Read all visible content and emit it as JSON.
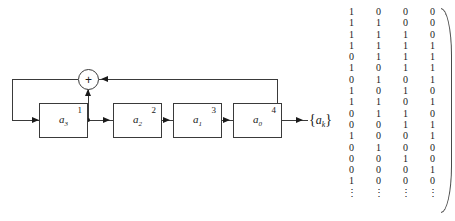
{
  "figure": {
    "kind": "lfsr-block-diagram-with-state-matrix",
    "output_label": {
      "open_brace": "{",
      "symbol": "a",
      "subscript": "k",
      "close_brace": "}"
    },
    "adder": {
      "symbol": "+",
      "name": "modulo-2-adder"
    },
    "stages": [
      {
        "symbol": "a",
        "subscript": "3",
        "tap": "1"
      },
      {
        "symbol": "a",
        "subscript": "2",
        "tap": "2"
      },
      {
        "symbol": "a",
        "subscript": "1",
        "tap": "3"
      },
      {
        "symbol": "a",
        "subscript": "0",
        "tap": "4"
      }
    ]
  },
  "matrix": {
    "columns": 4,
    "rows": [
      [
        "1",
        "0",
        "0",
        "0"
      ],
      [
        "1",
        "1",
        "0",
        "0"
      ],
      [
        "1",
        "1",
        "1",
        "0"
      ],
      [
        "1",
        "1",
        "1",
        "1"
      ],
      [
        "0",
        "1",
        "1",
        "1"
      ],
      [
        "1",
        "0",
        "1",
        "1"
      ],
      [
        "0",
        "1",
        "0",
        "1"
      ],
      [
        "1",
        "0",
        "1",
        "0"
      ],
      [
        "1",
        "1",
        "0",
        "1"
      ],
      [
        "0",
        "1",
        "1",
        "0"
      ],
      [
        "0",
        "0",
        "1",
        "1"
      ],
      [
        "1",
        "0",
        "0",
        "1"
      ],
      [
        "0",
        "1",
        "0",
        "0"
      ],
      [
        "0",
        "0",
        "1",
        "0"
      ],
      [
        "0",
        "0",
        "0",
        "1"
      ],
      [
        "1",
        "0",
        "0",
        "0"
      ],
      [
        "⋮",
        "⋮",
        "⋮",
        "⋮"
      ]
    ]
  },
  "colors": {
    "line": "#3a3a3a",
    "ink": "#1a1a1a",
    "background": "#ffffff"
  }
}
